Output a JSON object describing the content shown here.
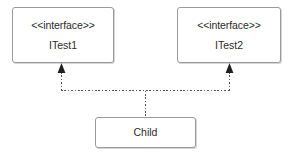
{
  "diagram": {
    "kind": "uml-class-diagram",
    "background_color": "#ffffff",
    "border_color": "#9a9a9a",
    "text_color": "#2b2b2b",
    "edge_color": "#555555"
  },
  "nodes": {
    "interface_left": {
      "stereotype": "<<interface>>",
      "name": "ITest1"
    },
    "interface_right": {
      "stereotype": "<<interface>>",
      "name": "ITest2"
    },
    "child": {
      "name": "Child"
    }
  },
  "edges": [
    {
      "type": "realization",
      "from": "Child",
      "to": "ITest1",
      "line_style": "dotted",
      "arrowhead": "closed-triangle"
    },
    {
      "type": "realization",
      "from": "Child",
      "to": "ITest2",
      "line_style": "dotted",
      "arrowhead": "closed-triangle"
    }
  ]
}
